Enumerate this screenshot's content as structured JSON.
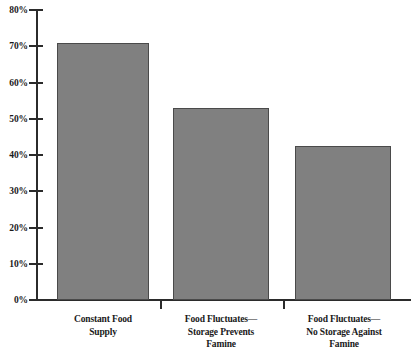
{
  "chart_data": {
    "type": "bar",
    "title": "",
    "subtitle": "",
    "xlabel": "",
    "ylabel": "",
    "categories": [
      "Constant Food\nSupply",
      "Food Fluctuates—\nStorage Prevents\nFamine",
      "Food Fluctuates—\nNo Storage Against\nFamine"
    ],
    "category_lines": [
      [
        "Constant Food",
        "Supply"
      ],
      [
        "Food Fluctuates—",
        "Storage Prevents",
        "Famine"
      ],
      [
        "Food Fluctuates—",
        "No Storage Against",
        "Famine"
      ]
    ],
    "values": [
      71,
      53,
      42.5
    ],
    "value_labels": [
      "71%",
      "53%",
      "42.5%"
    ],
    "ylim": [
      0,
      80
    ],
    "ytick_values": [
      0,
      10,
      20,
      30,
      40,
      50,
      60,
      70,
      80
    ],
    "ytick_labels": [
      "0%",
      "10%",
      "20%",
      "30%",
      "40%",
      "50%",
      "60%",
      "70%",
      "80%"
    ],
    "grid": false,
    "legend": false,
    "legend_position": "none",
    "bar_color": "#808080",
    "bar_edge_color": "#4a4a4a",
    "axis_color": "#2b2b2b",
    "background_color": "#ffffff"
  }
}
